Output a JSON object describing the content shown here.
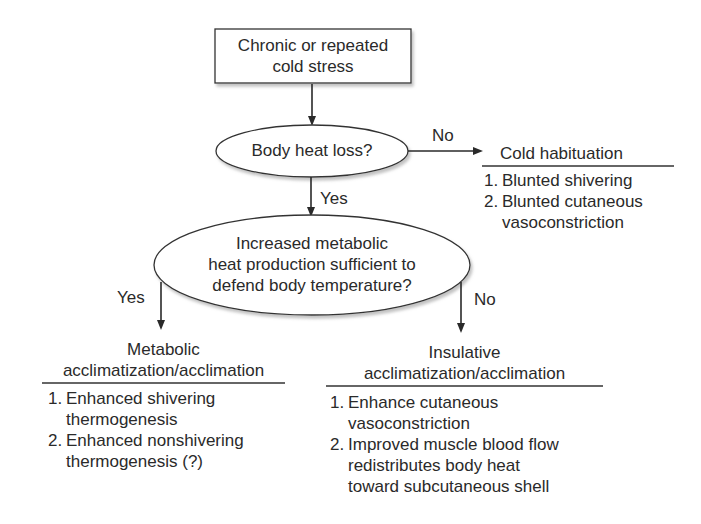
{
  "diagram": {
    "start_box": {
      "line1": "Chronic or repeated",
      "line2": "cold stress"
    },
    "decision1": {
      "label": "Body heat loss?",
      "no_label": "No",
      "yes_label": "Yes"
    },
    "cold_habituation": {
      "title": "Cold habituation",
      "items": [
        {
          "num": "1.",
          "text": [
            "Blunted shivering"
          ]
        },
        {
          "num": "2.",
          "text": [
            "Blunted cutaneous",
            "vasoconstriction"
          ]
        }
      ]
    },
    "decision2": {
      "line1": "Increased metabolic",
      "line2": "heat production sufficient to",
      "line3": "defend body temperature?",
      "yes_label": "Yes",
      "no_label": "No"
    },
    "metabolic": {
      "title1": "Metabolic",
      "title2": "acclimatization/acclimation",
      "items": [
        {
          "num": "1.",
          "text": [
            "Enhanced shivering",
            "thermogenesis"
          ]
        },
        {
          "num": "2.",
          "text": [
            "Enhanced nonshivering",
            "thermogenesis (?)"
          ]
        }
      ]
    },
    "insulative": {
      "title1": "Insulative",
      "title2": "acclimatization/acclimation",
      "items": [
        {
          "num": "1.",
          "text": [
            "Enhance cutaneous",
            "vasoconstriction"
          ]
        },
        {
          "num": "2.",
          "text": [
            "Improved muscle blood flow",
            "redistributes body heat",
            "toward subcutaneous shell"
          ]
        }
      ]
    }
  }
}
